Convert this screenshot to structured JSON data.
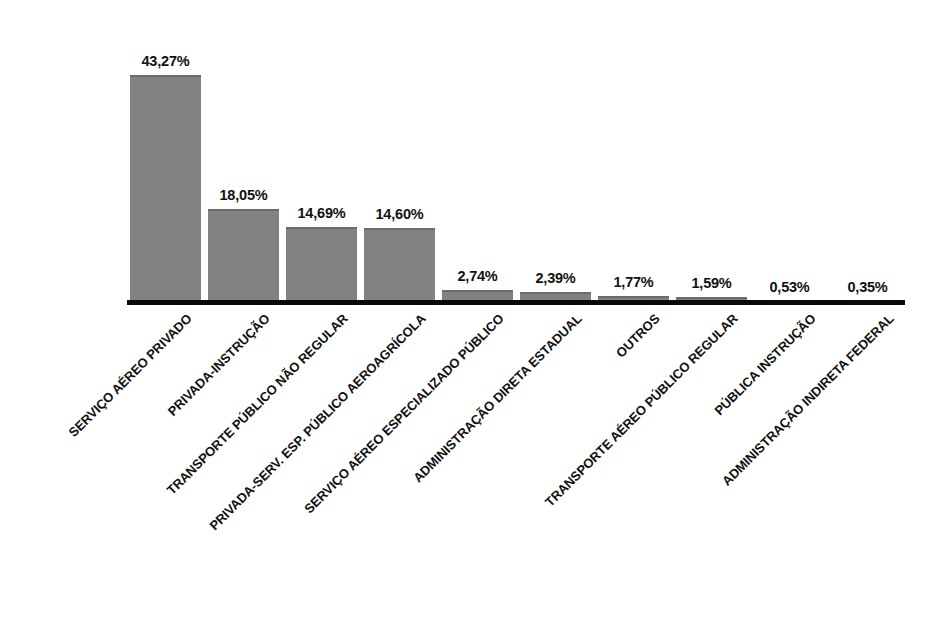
{
  "chart_data": {
    "type": "bar",
    "title": "",
    "subtitle": "",
    "xlabel": "",
    "ylabel": "",
    "grid": false,
    "legend": "none",
    "ylim": [
      0,
      46
    ],
    "value_suffix": "%",
    "decimal_separator": ",",
    "bar_color": "#828282",
    "axis_color": "#0a0a0a",
    "label_color": "#111111",
    "categories": [
      "SERVIÇO AÉREO PRIVADO",
      "PRIVADA-INSTRUÇÃO",
      "TRANSPORTE PÚBLICO NÃO REGULAR",
      "PRIVADA-SERV. ESP. PÚBLICO AEROAGRÍCOLA",
      "SERVIÇO AÉREO ESPECIALIZADO PÚBLICO",
      "ADMINISTRAÇÃO DIRETA ESTADUAL",
      "OUTROS",
      "TRANSPORTE AÉREO PÚBLICO REGULAR",
      "PÚBLICA INSTRUÇÃO",
      "ADMINISTRAÇÃO INDIRETA FEDERAL"
    ],
    "values": [
      43.27,
      18.05,
      14.69,
      14.6,
      2.74,
      2.39,
      1.77,
      1.59,
      0.53,
      0.35
    ],
    "value_labels": [
      "43,27%",
      "18,05%",
      "14,69%",
      "14,60%",
      "2,74%",
      "2,39%",
      "1,77%",
      "1,59%",
      "0,53%",
      "0,35%"
    ]
  },
  "bars": [
    {
      "label": "SERVIÇO AÉREO PRIVADO",
      "value": "43,27%",
      "num": 43.27,
      "x": 130
    },
    {
      "label": "PRIVADA-INSTRUÇÃO",
      "value": "18,05%",
      "num": 18.05,
      "x": 208
    },
    {
      "label": "TRANSPORTE PÚBLICO NÃO REGULAR",
      "value": "14,69%",
      "num": 14.69,
      "x": 286
    },
    {
      "label": "PRIVADA-SERV. ESP. PÚBLICO AEROAGRÍCOLA",
      "value": "14,60%",
      "num": 14.6,
      "x": 364
    },
    {
      "label": "SERVIÇO AÉREO ESPECIALIZADO PÚBLICO",
      "value": "2,74%",
      "num": 2.74,
      "x": 442
    },
    {
      "label": "ADMINISTRAÇÃO DIRETA ESTADUAL",
      "value": "2,39%",
      "num": 2.39,
      "x": 520
    },
    {
      "label": "OUTROS",
      "value": "1,77%",
      "num": 1.77,
      "x": 598
    },
    {
      "label": "TRANSPORTE AÉREO PÚBLICO REGULAR",
      "value": "1,59%",
      "num": 1.59,
      "x": 676
    },
    {
      "label": "PÚBLICA INSTRUÇÃO",
      "value": "0,53%",
      "num": 0.53,
      "x": 754
    },
    {
      "label": "ADMINISTRAÇÃO INDIRETA FEDERAL",
      "value": "0,35%",
      "num": 0.35,
      "x": 832
    }
  ]
}
